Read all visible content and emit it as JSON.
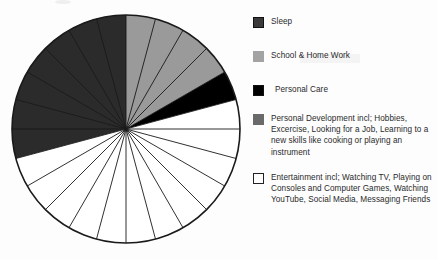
{
  "chart_data": {
    "type": "pie",
    "title": "",
    "subtitle": "",
    "total_units": 24,
    "unit": "hours",
    "start_angle_deg": -90,
    "direction": "clockwise",
    "grid": false,
    "legend_position": "right",
    "annotations": [],
    "slice_lines": "hourly dividers every 15 degrees (24 divisions)",
    "categories": [
      "Sleep",
      "School & Home Work",
      "Personal Care",
      "Personal Development",
      "Entertainment"
    ],
    "values": [
      8,
      4,
      1,
      0,
      11
    ],
    "percentages": [
      33.3,
      16.7,
      4.2,
      0,
      45.8
    ],
    "colors": [
      "#2b2b2b",
      "#9a9a9a",
      "#000000",
      "#6a6a6a",
      "#ffffff"
    ],
    "series": [
      {
        "name": "Hours in a day",
        "values": [
          8,
          4,
          1,
          0,
          11
        ]
      }
    ],
    "xlabel": "",
    "ylabel": ""
  },
  "legend": {
    "items": [
      {
        "label": "Sleep",
        "color": "#3a3a3a",
        "hours": 8
      },
      {
        "label": "School & Home Work",
        "color": "#9a9a9a",
        "hours": 4
      },
      {
        "label": "Personal Care",
        "color": "#000000",
        "hours": 1
      },
      {
        "label": "Personal Development incl; Hobbies, Excercise, Looking for a Job, Learning to a new skills like cooking or playing an instrument",
        "color": "#6a6a6a",
        "hours": 0
      },
      {
        "label": "Entertainment incl; Watching TV, Playing on Consoles and Computer Games, Watching YouTube, Social Media, Messaging Friends",
        "color": "#ffffff",
        "hours": 11
      }
    ]
  },
  "pie": {
    "center_x": 117,
    "center_y": 118,
    "radius": 114,
    "stroke": "#1a1a1a",
    "wedges": [
      {
        "name": "sleep",
        "start_deg": 255,
        "end_deg": 375,
        "color": "#2b2b2b"
      },
      {
        "name": "school-home-work",
        "start_deg": 0,
        "end_deg": 60,
        "color": "#9a9a9a"
      },
      {
        "name": "personal-care",
        "start_deg": 60,
        "end_deg": 75,
        "color": "#000000"
      },
      {
        "name": "entertainment",
        "start_deg": 75,
        "end_deg": 255,
        "color": "#ffffff"
      }
    ]
  }
}
